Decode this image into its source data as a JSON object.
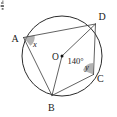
{
  "figure": {
    "type": "geometry-diagram",
    "background_color": "#ffffff",
    "stroke_color": "#2b2b2b",
    "shade_color": "#9a9a9a"
  },
  "labels": {
    "point_a": "A",
    "point_b": "B",
    "point_c": "C",
    "point_d": "D",
    "center_o": "O",
    "angle_x": "x",
    "angle_y": "y",
    "central_angle": "140°",
    "corner_mark": "4"
  },
  "geometry": {
    "circle": {
      "cx": 62,
      "cy": 56,
      "r": 40
    },
    "points": {
      "A": {
        "x": 23.5,
        "y": 37.5
      },
      "B": {
        "x": 52.0,
        "y": 95.5
      },
      "C": {
        "x": 93.5,
        "y": 74.5
      },
      "D": {
        "x": 95.5,
        "y": 24.0
      }
    },
    "chords": [
      "A-D",
      "A-B",
      "B-C",
      "C-D"
    ],
    "radii": [
      "O-B",
      "O-D"
    ],
    "central_angle_degrees": 140,
    "marked_angles": [
      {
        "name": "x",
        "vertex": "A",
        "rays": [
          "A-D",
          "A-B"
        ],
        "shaded": true
      },
      {
        "name": "y",
        "vertex": "C",
        "rays": [
          "C-B",
          "C-D"
        ],
        "shaded": true
      }
    ]
  }
}
